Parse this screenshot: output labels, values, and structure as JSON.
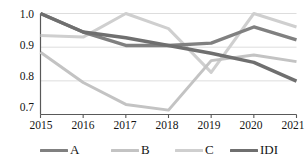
{
  "chart_data": {
    "type": "line",
    "title": "",
    "xlabel": "",
    "ylabel": "",
    "x": [
      2015,
      2016,
      2017,
      2018,
      2019,
      2020,
      2021
    ],
    "categories": [
      "2015",
      "2016",
      "2017",
      "2018",
      "2019",
      "2020",
      "2021"
    ],
    "xtick_labels": [
      "2015",
      "2016",
      "2017",
      "2018",
      "2019",
      "2020",
      "2021"
    ],
    "ytick_labels": [
      "1.0",
      "0.9",
      "0.8",
      "0.7"
    ],
    "yticks": [
      1.0,
      0.9,
      0.8,
      0.7
    ],
    "ylim": [
      0.7,
      1.0
    ],
    "xlim": [
      2015,
      2021
    ],
    "grid": "horizontal",
    "legend_position": "bottom",
    "series": [
      {
        "name": "A",
        "color": "#808080",
        "width": 3.4,
        "values": [
          1.0,
          0.945,
          0.905,
          0.905,
          0.912,
          0.96,
          0.922
        ]
      },
      {
        "name": "B",
        "color": "#c3c3c3",
        "width": 3.0,
        "values": [
          0.885,
          0.795,
          0.73,
          0.713,
          0.86,
          0.877,
          0.857
        ]
      },
      {
        "name": "C",
        "color": "#cfcfcf",
        "width": 3.0,
        "values": [
          0.935,
          0.93,
          1.0,
          0.955,
          0.825,
          1.0,
          0.96
        ]
      },
      {
        "name": "IDI",
        "color": "#6f6f6f",
        "width": 3.4,
        "values": [
          1.0,
          0.945,
          0.928,
          0.905,
          0.882,
          0.855,
          0.799
        ]
      }
    ],
    "legend": [
      {
        "label": "A",
        "color": "#808080"
      },
      {
        "label": "B",
        "color": "#c3c3c3"
      },
      {
        "label": "C",
        "color": "#cfcfcf"
      },
      {
        "label": "IDI",
        "color": "#6f6f6f"
      }
    ]
  },
  "axis": {
    "y_labels": [
      "1.0",
      "0.9",
      "0.8",
      "0.7"
    ],
    "x_labels": [
      "2015",
      "2016",
      "2017",
      "2018",
      "2019",
      "2020",
      "2021"
    ]
  },
  "legend": {
    "items": [
      {
        "label": "A"
      },
      {
        "label": "B"
      },
      {
        "label": "C"
      },
      {
        "label": "IDI"
      }
    ]
  }
}
